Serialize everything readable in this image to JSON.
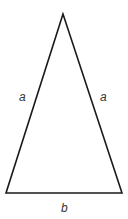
{
  "diagram": {
    "type": "isosceles-triangle",
    "stroke_color": "#1a1a1a",
    "label_color": "#333333",
    "vertices": {
      "apex": [
        63,
        14
      ],
      "bottom_left": [
        6,
        193
      ],
      "bottom_right": [
        122,
        193
      ]
    },
    "labels": {
      "left_side": "a",
      "right_side": "a",
      "base": "b"
    }
  }
}
